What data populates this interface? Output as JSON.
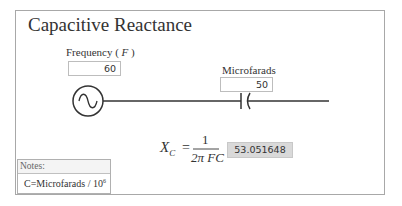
{
  "title": "Capacitive Reactance",
  "inputs": {
    "frequency": {
      "label_prefix": "Frequency ( ",
      "label_var": "F",
      "label_suffix": " )",
      "value": "60"
    },
    "microfarads": {
      "label": "Microfarads",
      "value": "50"
    }
  },
  "formula": {
    "lhs": "X",
    "lhs_sub": "C",
    "equals": "=",
    "numerator": "1",
    "denominator": "2π FC"
  },
  "result": {
    "value": "53.051648"
  },
  "notes": {
    "header": "Notes:",
    "text": "C=Microfarads / 10",
    "superscript": "6"
  },
  "diagram": {
    "source_icon": "ac-voltage-source-icon",
    "capacitor_icon": "capacitor-icon"
  }
}
